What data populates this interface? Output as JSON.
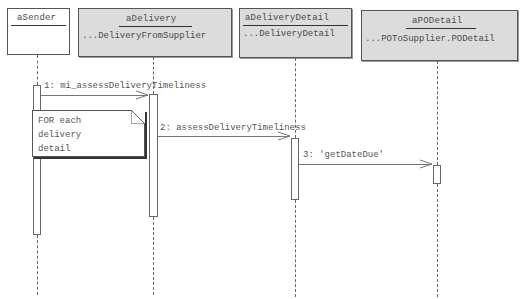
{
  "diagram": {
    "type": "UML sequence diagram",
    "objects": [
      {
        "name": "aSender",
        "class": ""
      },
      {
        "name": "aDelivery",
        "class": "...DeliveryFromSupplier"
      },
      {
        "name": "aDeliveryDetail",
        "class": "...DeliveryDetail"
      },
      {
        "name": "aPODetail",
        "class": "...POToSupplier.PODetail"
      }
    ],
    "messages": [
      {
        "label": "1: mi_assessDeliveryTimeliness",
        "from": "aSender",
        "to": "aDelivery"
      },
      {
        "label": "2: assessDeliveryTimeliness",
        "from": "aDelivery",
        "to": "aDeliveryDetail"
      },
      {
        "label": "3: 'getDateDue'",
        "from": "aDeliveryDetail",
        "to": "aPODetail"
      }
    ],
    "note": {
      "text": "FOR each\ndelivery\ndetail"
    }
  }
}
